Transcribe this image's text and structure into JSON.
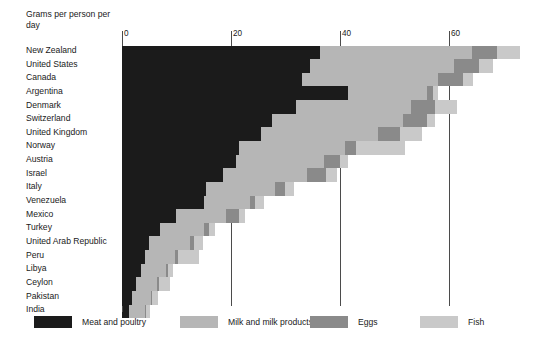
{
  "chart_data": {
    "type": "bar",
    "subtype": "stacked-horizontal-bar",
    "title": "",
    "axis_title": "Grams per person per day",
    "xlabel": "",
    "ylabel": "",
    "xlim": [
      0,
      74.5
    ],
    "ticks": [
      0,
      20,
      40,
      60
    ],
    "tick_labels": [
      "0",
      "20",
      "40",
      "60"
    ],
    "grid": true,
    "legend_position": "bottom",
    "orientation": "horizontal",
    "categories": [
      "New Zealand",
      "United States",
      "Canada",
      "Argentina",
      "Denmark",
      "Switzerland",
      "United Kingdom",
      "Norway",
      "Austria",
      "Israel",
      "Italy",
      "Venezuela",
      "Mexico",
      "Turkey",
      "United Arab Republic",
      "Peru",
      "Libya",
      "Ceylon",
      "Pakistan",
      "India"
    ],
    "series": [
      {
        "name": "Meat and poultry",
        "color": "#1b1b1b",
        "values": [
          36.3,
          34.5,
          33.0,
          41.5,
          32.0,
          27.5,
          25.5,
          21.5,
          21.0,
          18.5,
          15.5,
          15.0,
          10.0,
          7.0,
          5.0,
          4.2,
          3.5,
          2.5,
          1.8,
          1.2
        ]
      },
      {
        "name": "Milk and milk products",
        "color": "#b6b6b6",
        "values": [
          28.0,
          26.5,
          25.0,
          14.5,
          21.0,
          24.0,
          21.5,
          19.5,
          16.0,
          15.5,
          12.5,
          8.5,
          9.0,
          8.0,
          7.5,
          5.5,
          4.5,
          4.0,
          3.5,
          3.0
        ]
      },
      {
        "name": "Eggs",
        "color": "#8a8a8a",
        "values": [
          4.5,
          4.5,
          4.5,
          1.0,
          4.5,
          4.5,
          4.0,
          2.0,
          3.0,
          3.5,
          2.0,
          1.0,
          2.5,
          1.0,
          0.8,
          0.5,
          0.4,
          0.3,
          0.3,
          0.2
        ]
      },
      {
        "name": "Fish",
        "color": "#c9c9c9",
        "values": [
          4.2,
          2.5,
          2.0,
          1.0,
          4.0,
          1.5,
          4.0,
          9.0,
          1.5,
          2.0,
          1.5,
          1.5,
          1.0,
          1.0,
          1.5,
          4.0,
          1.0,
          2.0,
          1.0,
          0.8
        ]
      }
    ],
    "legend": [
      {
        "label": "Meat and poultry",
        "color": "#1b1b1b"
      },
      {
        "label": "Milk and milk products",
        "color": "#b6b6b6"
      },
      {
        "label": "Eggs",
        "color": "#8a8a8a"
      },
      {
        "label": "Fish",
        "color": "#c9c9c9"
      }
    ]
  }
}
